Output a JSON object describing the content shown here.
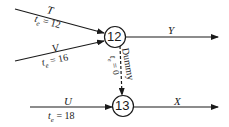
{
  "nodes": [
    {
      "id": "12",
      "label": "12"
    },
    {
      "id": "13",
      "label": "13"
    }
  ],
  "edges": {
    "T": {
      "activity": "T",
      "te_label": "t",
      "te_sub": "e",
      "te_value": "= 12"
    },
    "V": {
      "activity": "V",
      "te_label": "t",
      "te_sub": "e",
      "te_value": "= 16"
    },
    "Y": {
      "activity": "Y"
    },
    "dummy": {
      "activity": "Dummy",
      "te_label": "t",
      "te_sub": "e",
      "te_value": "= 0"
    },
    "U": {
      "activity": "U",
      "te_label": "t",
      "te_sub": "e",
      "te_value": "= 18"
    },
    "X": {
      "activity": "X"
    }
  },
  "colors": {
    "stroke": "#1a1a1a",
    "background": "#ffffff"
  }
}
